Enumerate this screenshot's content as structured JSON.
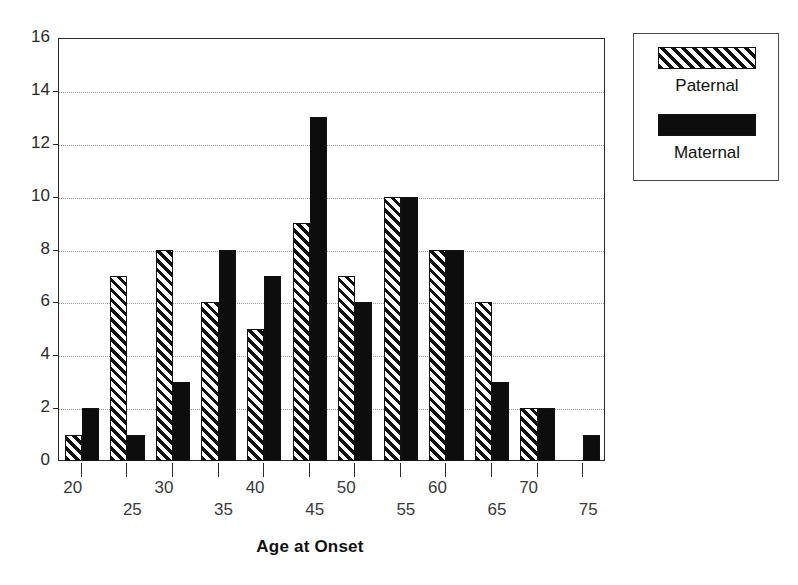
{
  "chart_data": {
    "type": "bar",
    "title": "",
    "xlabel": "Age at Onset",
    "ylabel": "",
    "categories": [
      "20",
      "25",
      "30",
      "35",
      "40",
      "45",
      "50",
      "55",
      "60",
      "65",
      "70",
      "75"
    ],
    "series": [
      {
        "name": "Paternal",
        "values": [
          1,
          7,
          8,
          6,
          5,
          9,
          7,
          10,
          8,
          6,
          2,
          0
        ]
      },
      {
        "name": "Maternal",
        "values": [
          2,
          1,
          3,
          8,
          7,
          13,
          6,
          10,
          8,
          3,
          2,
          1
        ]
      }
    ],
    "ylim": [
      0,
      16
    ],
    "yticks": [
      0,
      2,
      4,
      6,
      8,
      10,
      12,
      14,
      16
    ],
    "ytick_labels": [
      "0",
      "2",
      "4",
      "6",
      "8",
      "10",
      "12",
      "14",
      "16"
    ],
    "grid": true,
    "grid_axis": "y",
    "legend_position": "outside-right-top",
    "xtick_labels_staggered": true
  },
  "legend": {
    "entries": [
      {
        "label": "Paternal",
        "style": "diagonal-hatch",
        "color": "#111111"
      },
      {
        "label": "Maternal",
        "style": "solid",
        "color": "#0d0d0d"
      }
    ]
  },
  "axis": {
    "x_title": "Age at Onset"
  },
  "colors": {
    "paternal_hatch": "#111111",
    "maternal_fill": "#0d0d0d",
    "axis": "#2b2b2b",
    "gridline": "#9a9a9a",
    "background": "#ffffff"
  }
}
